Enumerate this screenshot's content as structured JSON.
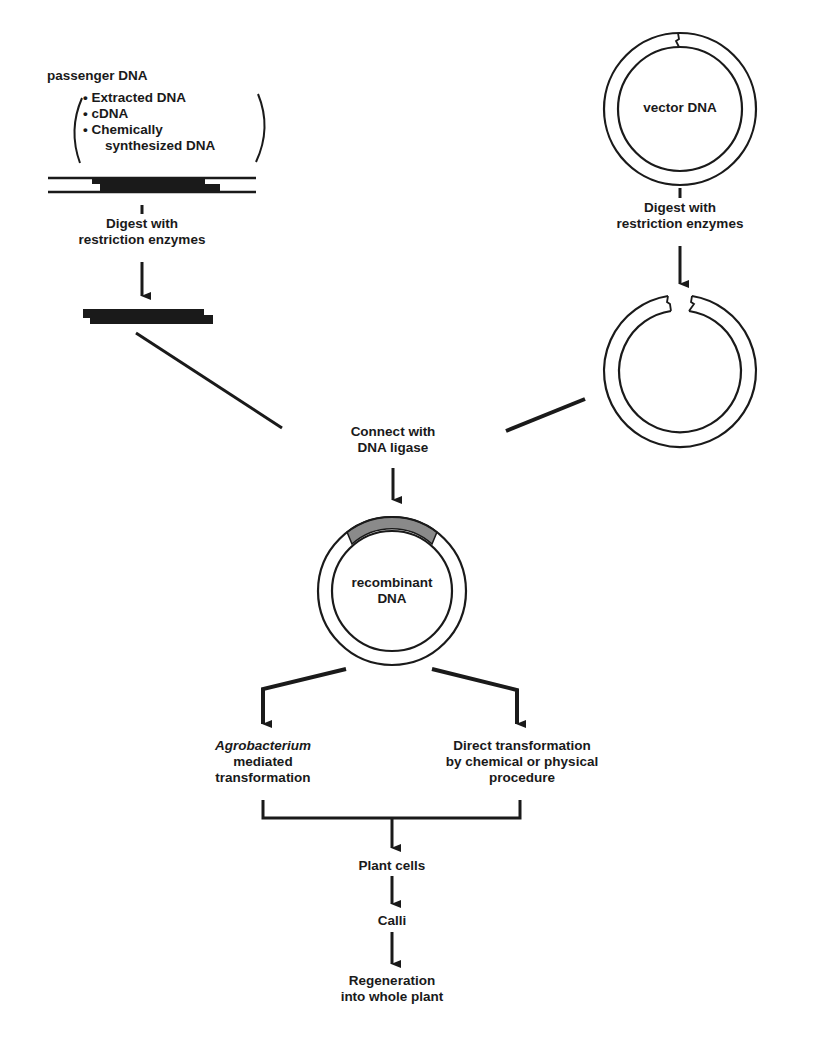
{
  "colors": {
    "ink": "#1a1a1a",
    "insert_fill": "#8a8a8a",
    "background": "#ffffff"
  },
  "passenger": {
    "title": "passenger DNA",
    "sources": [
      "Extracted DNA",
      "cDNA",
      "Chemically",
      "synthesized DNA"
    ],
    "bullet": "•"
  },
  "vector": {
    "label": "vector DNA"
  },
  "steps": {
    "digest_left": [
      "Digest with",
      "restriction enzymes"
    ],
    "digest_right": [
      "Digest with",
      "restriction enzymes"
    ],
    "ligase": [
      "Connect with",
      "DNA ligase"
    ],
    "recombinant": [
      "recombinant",
      "DNA"
    ],
    "agro": [
      "Agrobacterium",
      "mediated",
      "transformation"
    ],
    "direct": [
      "Direct transformation",
      "by chemical or physical",
      "procedure"
    ],
    "plant_cells": "Plant cells",
    "calli": "Calli",
    "regeneration": [
      "Regeneration",
      "into whole plant"
    ]
  }
}
